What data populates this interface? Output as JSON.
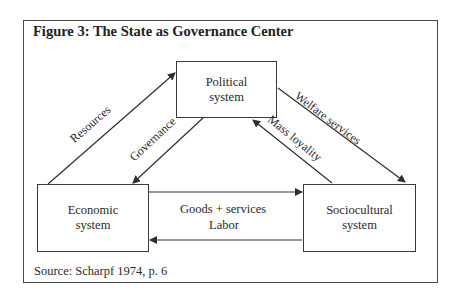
{
  "figure": {
    "title": "Figure 3: The State as Governance Center",
    "source": "Source: Scharpf 1974, p. 6"
  },
  "nodes": {
    "political": {
      "line1": "Political",
      "line2": "system"
    },
    "economic": {
      "line1": "Economic",
      "line2": "system"
    },
    "sociocultural": {
      "line1": "Sociocultural",
      "line2": "system"
    }
  },
  "edges": {
    "resources": {
      "label": "Resources",
      "from": "Economic system",
      "to": "Political system"
    },
    "governance": {
      "label": "Governance",
      "from": "Political system",
      "to": "Economic system"
    },
    "welfare": {
      "label": "Welfare services",
      "from": "Political system",
      "to": "Sociocultural system"
    },
    "loyalty": {
      "label": "Mass loyality",
      "from": "Sociocultural system",
      "to": "Political system"
    },
    "goods": {
      "label": "Goods + services",
      "from": "Economic system",
      "to": "Sociocultural system"
    },
    "labor": {
      "label": "Labor",
      "from": "Sociocultural system",
      "to": "Economic system"
    }
  },
  "colors": {
    "line": "#2e2e2e",
    "text": "#2a2a2a"
  }
}
